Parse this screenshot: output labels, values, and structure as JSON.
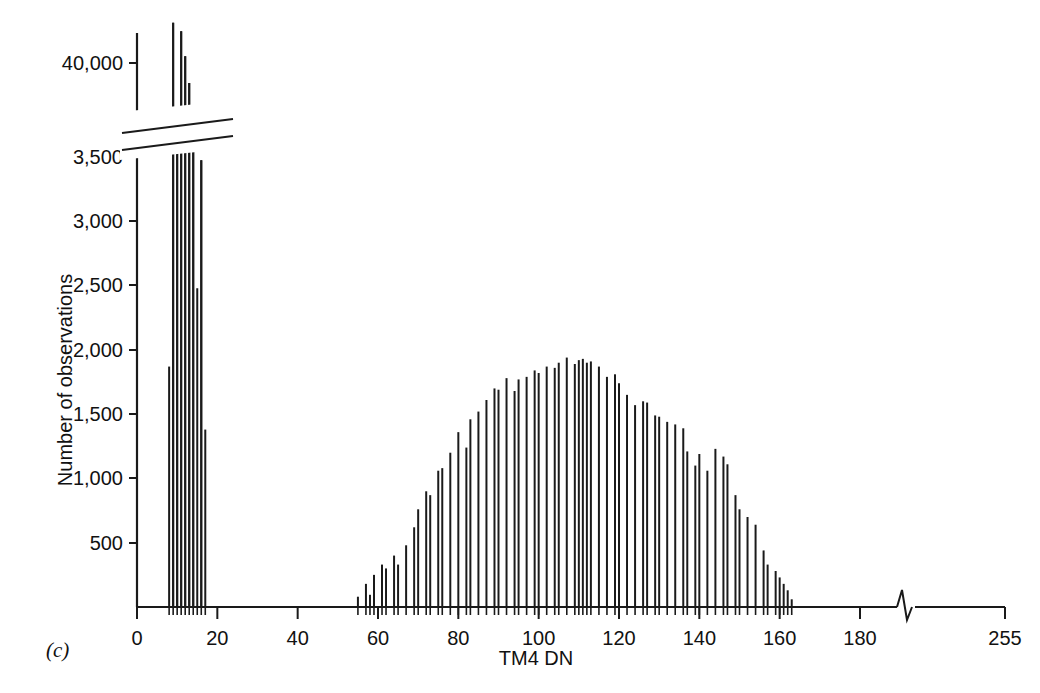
{
  "figure": {
    "panel_label": "(c)",
    "background_color": "#ffffff",
    "ink_color": "#1a1a1a"
  },
  "chart_data": {
    "type": "bar",
    "title": "",
    "subtitle": "",
    "xlabel": "TM4 DN",
    "ylabel": "Number of observations",
    "grid": false,
    "legend": null,
    "annotations": [
      "y-axis has a scale break between 3,500 and 40,000",
      "x-axis has a scale break between 180 and 255"
    ],
    "xlim": [
      0,
      255
    ],
    "ylim": [
      0,
      42500
    ],
    "y_axis_break": {
      "lower_max": 3500,
      "upper_min": 39000,
      "upper_max": 42500
    },
    "x_axis_break": {
      "lower_max": 190,
      "upper_min": 240,
      "break_symbol": "zigzag"
    },
    "xticks": [
      0,
      20,
      40,
      60,
      80,
      100,
      120,
      140,
      160,
      180,
      255
    ],
    "xticklabels": [
      "0",
      "20",
      "40",
      "60",
      "80",
      "100",
      "120",
      "140",
      "160",
      "180",
      "255"
    ],
    "yticks": [
      500,
      1000,
      1500,
      2000,
      2500,
      3000,
      3500,
      40000
    ],
    "yticklabels": [
      "500",
      "1,000",
      "1,500",
      "2,000",
      "2,500",
      "3,000",
      "3,500",
      "40,000"
    ],
    "bar_width_px": 2,
    "categories": [
      8,
      9,
      10,
      11,
      12,
      13,
      14,
      15,
      16,
      17,
      18,
      19,
      20,
      55,
      56,
      57,
      58,
      59,
      60,
      61,
      62,
      63,
      64,
      65,
      66,
      67,
      68,
      69,
      70,
      71,
      72,
      73,
      74,
      75,
      76,
      77,
      78,
      79,
      80,
      81,
      82,
      83,
      84,
      85,
      86,
      87,
      88,
      89,
      90,
      91,
      92,
      93,
      94,
      95,
      96,
      97,
      98,
      99,
      100,
      101,
      102,
      103,
      104,
      105,
      106,
      107,
      108,
      109,
      110,
      111,
      112,
      113,
      114,
      115,
      116,
      117,
      118,
      119,
      120,
      121,
      122,
      123,
      124,
      125,
      126,
      127,
      128,
      129,
      130,
      131,
      132,
      133,
      134,
      135,
      136,
      137,
      138,
      139,
      140,
      141,
      142,
      143,
      144,
      145,
      146,
      147,
      148,
      149,
      150,
      151,
      152,
      153,
      154,
      155,
      156,
      157,
      158,
      159,
      160,
      161,
      162,
      163
    ],
    "values": [
      1870,
      42400,
      36700,
      41900,
      40400,
      38800,
      35400,
      2480,
      34200,
      1380,
      0,
      0,
      0,
      80,
      0,
      180,
      95,
      250,
      0,
      330,
      300,
      0,
      400,
      330,
      0,
      480,
      0,
      620,
      760,
      0,
      900,
      870,
      0,
      1060,
      1080,
      0,
      1200,
      0,
      1360,
      0,
      1240,
      1460,
      0,
      1520,
      0,
      1610,
      0,
      1700,
      1690,
      0,
      1780,
      0,
      1680,
      1770,
      0,
      1790,
      0,
      1840,
      1820,
      0,
      1870,
      0,
      1860,
      1900,
      0,
      1940,
      0,
      1890,
      1920,
      1930,
      1900,
      1910,
      0,
      1870,
      0,
      1790,
      0,
      1810,
      1740,
      0,
      1650,
      0,
      1570,
      0,
      1600,
      1590,
      0,
      1490,
      1480,
      0,
      1440,
      0,
      1420,
      0,
      1390,
      1210,
      0,
      1100,
      1190,
      0,
      1060,
      0,
      1230,
      0,
      1170,
      1110,
      0,
      870,
      760,
      0,
      700,
      0,
      640,
      0,
      440,
      330,
      0,
      280,
      230,
      180,
      130,
      60
    ],
    "series": [
      {
        "name": "TM4 DN frequency",
        "description": "Landsat TM band 4 digital-number histogram; large water/dark-pixel spike near DN 8-20 and broad land-surface mode centred near DN 110",
        "peak_low_cluster_dn": 9,
        "peak_low_cluster_value": 42400,
        "peak_main_mode_dn": 111,
        "peak_main_mode_value": 1930
      }
    ]
  }
}
